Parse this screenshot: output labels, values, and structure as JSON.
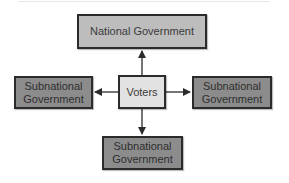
{
  "diagram": {
    "nodes": {
      "national": {
        "label": "National Government"
      },
      "voters": {
        "label": "Voters"
      },
      "sub_left": {
        "line1": "Subnational",
        "line2": "Government"
      },
      "sub_right": {
        "line1": "Subnational",
        "line2": "Government"
      },
      "sub_bottom": {
        "line1": "Subnational",
        "line2": "Government"
      }
    },
    "edges": [
      {
        "from": "Voters",
        "to": "National Government"
      },
      {
        "from": "Voters",
        "to": "Subnational Government (left)"
      },
      {
        "from": "Voters",
        "to": "Subnational Government (right)"
      },
      {
        "from": "Voters",
        "to": "Subnational Government (bottom)"
      }
    ],
    "colors": {
      "national_fill": "#bdbdbd",
      "voters_fill": "#e2e2e2",
      "subnational_fill": "#8c8c8c",
      "border": "#2b2b2b"
    }
  }
}
